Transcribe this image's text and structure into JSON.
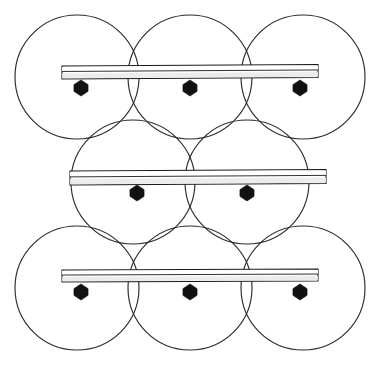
{
  "figure": {
    "title": "Hexagonal close-packed circle array with three bolted mounting rails",
    "canvas": {
      "width": 379,
      "height": 365,
      "background": "#ffffff"
    },
    "stroke_colors": {
      "circle_outline": "#2b2b2b",
      "rail_outline": "#1a1a1a",
      "rail_fill": "#fdfdfd",
      "rail_shade": "#e9e9e9",
      "bolt_fill": "#111111"
    },
    "circle_radius": 62,
    "circle_rows": [
      {
        "row_name": "top-row",
        "count": 3,
        "center_y": 77,
        "centers_x": [
          77,
          190,
          303
        ]
      },
      {
        "row_name": "middle-row",
        "count": 2,
        "center_y": 182,
        "centers_x": [
          133,
          247
        ]
      },
      {
        "row_name": "bottom-row",
        "count": 3,
        "center_y": 288,
        "centers_x": [
          77,
          190,
          303
        ]
      }
    ],
    "rails": [
      {
        "rail_name": "top-rail",
        "x_start": 62,
        "x_end": 318,
        "y_top": 66,
        "height": 13,
        "tilt": -1.5,
        "bolts_x": [
          81,
          190,
          300
        ],
        "bolt_y": 88
      },
      {
        "rail_name": "middle-rail",
        "x_start": 70,
        "x_end": 326,
        "y_top": 171,
        "height": 14,
        "tilt": -1.5,
        "bolts_x": [
          137,
          247
        ],
        "bolt_y": 193
      },
      {
        "rail_name": "bottom-rail",
        "x_start": 62,
        "x_end": 318,
        "y_top": 270,
        "height": 12,
        "tilt": -1.0,
        "bolts_x": [
          81,
          190,
          300
        ],
        "bolt_y": 292
      }
    ],
    "bolt": {
      "shape": "hexagon",
      "radius_x": 9,
      "radius_y": 8,
      "count_total": 8
    }
  }
}
